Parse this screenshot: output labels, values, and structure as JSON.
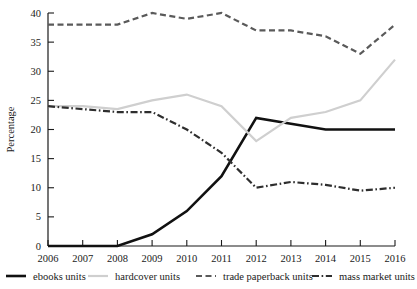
{
  "chart_data": {
    "type": "line",
    "title": "",
    "xlabel": "",
    "ylabel": "Percentage",
    "x": [
      2006,
      2007,
      2008,
      2009,
      2010,
      2011,
      2012,
      2013,
      2014,
      2015,
      2016
    ],
    "categories": [
      "2006",
      "2007",
      "2008",
      "2009",
      "2010",
      "2011",
      "2012",
      "2013",
      "2014",
      "2015",
      "2016"
    ],
    "xlim": [
      2006,
      2016
    ],
    "ylim": [
      0,
      40
    ],
    "yticks": [
      0,
      5,
      10,
      15,
      20,
      25,
      30,
      35,
      40
    ],
    "ytick_labels": [
      "0",
      "5",
      "10",
      "15",
      "20",
      "25",
      "30",
      "35",
      "40"
    ],
    "xtick_labels": [
      "2006",
      "2007",
      "2008",
      "2009",
      "2010",
      "2011",
      "2012",
      "2013",
      "2014",
      "2015",
      "2016"
    ],
    "grid": false,
    "legend_position": "below",
    "series": [
      {
        "name": "ebooks units",
        "color": "#111111",
        "style": "solid",
        "width": 2.6,
        "values": [
          0,
          0,
          0,
          2,
          6,
          12,
          22,
          21,
          20,
          20,
          20
        ]
      },
      {
        "name": "hardcover units",
        "color": "#cfcfcf",
        "style": "solid",
        "width": 2.2,
        "values": [
          24,
          24,
          23.5,
          25,
          26,
          24,
          18,
          22,
          23,
          25,
          32
        ]
      },
      {
        "name": "trade paperback units",
        "color": "#5a5a5a",
        "style": "dashed",
        "width": 2.2,
        "values": [
          38,
          38,
          38,
          40,
          39,
          40,
          37,
          37,
          36,
          33,
          38
        ]
      },
      {
        "name": "mass market units",
        "color": "#2e2e2e",
        "style": "dashdot",
        "width": 2.2,
        "values": [
          24,
          23.5,
          23,
          23,
          20,
          16,
          10,
          11,
          10.5,
          9.5,
          10
        ]
      }
    ]
  },
  "legend": {
    "items": [
      {
        "label": "ebooks units"
      },
      {
        "label": "hardcover units"
      },
      {
        "label": "trade paperback units"
      },
      {
        "label": "mass market units"
      }
    ]
  }
}
